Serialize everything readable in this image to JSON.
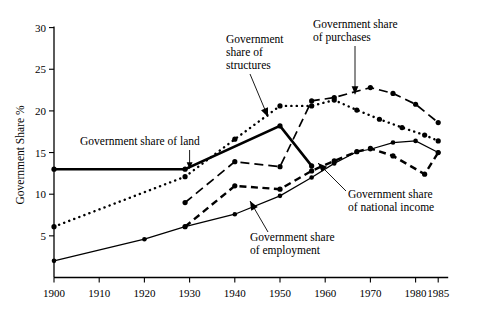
{
  "figure": {
    "background_color": "#ffffff",
    "ink_color": "#000000"
  },
  "chart_data": {
    "type": "line",
    "title": "",
    "subtitle": "",
    "xlabel": "",
    "ylabel": "Government Share %",
    "xlim": [
      1900,
      1985
    ],
    "ylim": [
      0,
      30
    ],
    "grid": false,
    "legend_position": "inline-annotations",
    "x_ticks": [
      1900,
      1910,
      1920,
      1930,
      1940,
      1950,
      1960,
      1970,
      1980,
      1985
    ],
    "x_tick_labels": [
      "1900",
      "1910",
      "1920",
      "1930",
      "1940",
      "1950",
      "1960",
      "1970",
      "1980",
      "1985"
    ],
    "y_ticks": [
      5,
      10,
      15,
      20,
      25,
      30
    ],
    "y_tick_labels": [
      "5",
      "10",
      "15",
      "20",
      "25",
      "30"
    ],
    "series": [
      {
        "name": "Government share of land",
        "label": "Government share of land",
        "style": "solid-thick",
        "x": [
          1900,
          1929,
          1950,
          1957
        ],
        "values": [
          13.0,
          13.0,
          18.2,
          13.4
        ],
        "markers": true
      },
      {
        "name": "Government share of structures",
        "label": "Government share of structures",
        "style": "dotted",
        "x": [
          1900,
          1929,
          1940,
          1950,
          1957,
          1962,
          1967,
          1972,
          1977,
          1982,
          1985
        ],
        "values": [
          6.1,
          12.1,
          16.6,
          20.6,
          20.6,
          21.3,
          20.1,
          19.0,
          18.0,
          17.1,
          16.4
        ],
        "markers": true
      },
      {
        "name": "Government share of purchases",
        "label": "Government share of purchases",
        "style": "dashed-long",
        "x": [
          1929,
          1940,
          1950,
          1957,
          1962,
          1970,
          1975,
          1980,
          1985
        ],
        "values": [
          9.0,
          13.9,
          13.3,
          21.2,
          21.6,
          22.8,
          22.1,
          20.8,
          18.6
        ],
        "markers": true
      },
      {
        "name": "Government share of national income",
        "label": "Government share of national income",
        "style": "dashed-medium",
        "x": [
          1929,
          1940,
          1950,
          1957,
          1962,
          1967,
          1970,
          1975,
          1982,
          1985
        ],
        "values": [
          6.1,
          11.0,
          10.6,
          12.8,
          14.0,
          15.1,
          15.5,
          14.6,
          12.4,
          15.0
        ],
        "markers": true
      },
      {
        "name": "Government share of employment",
        "label": "Government share of employment",
        "style": "solid-thin",
        "x": [
          1900,
          1920,
          1929,
          1940,
          1950,
          1957,
          1962,
          1967,
          1970,
          1975,
          1980,
          1985
        ],
        "values": [
          2.0,
          4.6,
          6.1,
          7.6,
          9.8,
          12.0,
          13.7,
          15.1,
          15.4,
          16.2,
          16.4,
          15.0
        ],
        "markers": true
      }
    ],
    "annotations": [
      {
        "text": "Government share of land",
        "lines": [
          "Government share of land"
        ],
        "anchor_x": 1930,
        "anchor_y": 13.0
      },
      {
        "text": "Government share of structures",
        "lines": [
          "Government",
          "share of",
          "structures"
        ],
        "anchor_x": 1935,
        "anchor_y": 15.5
      },
      {
        "text": "Government share of purchases",
        "lines": [
          "Government share",
          "of purchases"
        ],
        "anchor_x": 1966,
        "anchor_y": 21.6
      },
      {
        "text": "Government share of national income",
        "lines": [
          "Government share",
          "of national income"
        ],
        "anchor_x": 1964,
        "anchor_y": 14.2
      },
      {
        "text": "Government share of employment",
        "lines": [
          "Government share",
          "of employment"
        ],
        "anchor_x": 1951,
        "anchor_y": 11.2
      }
    ]
  },
  "labels": {
    "y_axis_title": "Government Share %",
    "land": "Government share of land",
    "structures_l1": "Government",
    "structures_l2": "share of",
    "structures_l3": "structures",
    "purchases_l1": "Government share",
    "purchases_l2": "of purchases",
    "national_income_l1": "Government share",
    "national_income_l2": "of national income",
    "employment_l1": "Government share",
    "employment_l2": "of employment"
  },
  "x_tick_text": {
    "t0": "1900",
    "t1": "1910",
    "t2": "1920",
    "t3": "1930",
    "t4": "1940",
    "t5": "1950",
    "t6": "1960",
    "t7": "1970",
    "t8": "1980",
    "t9": "1985"
  },
  "y_tick_text": {
    "t5": "5",
    "t10": "10",
    "t15": "15",
    "t20": "20",
    "t25": "25",
    "t30": "30"
  }
}
